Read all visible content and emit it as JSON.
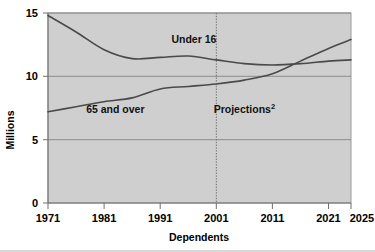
{
  "figure": {
    "background_color": "#ffffff",
    "plot_background_color": "#cfcfcf",
    "plot_border_color": "#9a9a9a",
    "gridline_color": "#8c8c8c",
    "series_line_color": "#4a4a4a",
    "projection_divider_color": "#707070",
    "truncated_title": ""
  },
  "chart_data": {
    "type": "line",
    "title": "",
    "xlabel": "Dependents",
    "ylabel": "Millions",
    "xlim": [
      1971,
      2025
    ],
    "ylim": [
      0,
      15
    ],
    "xticks": [
      1971,
      1981,
      1991,
      2001,
      2011,
      2021,
      2025
    ],
    "xtick_labels": [
      "1971",
      "1981",
      "1991",
      "2001",
      "2011",
      "2021",
      "2025"
    ],
    "yticks": [
      0,
      5,
      10,
      15
    ],
    "ytick_labels": [
      "0",
      "5",
      "10",
      "15"
    ],
    "grid": "horizontal",
    "legend_position": "inline-annotations",
    "annotations": [
      {
        "name": "under-16-label",
        "text": "Under 16",
        "x": 1997,
        "y": 12.6
      },
      {
        "name": "65-and-over-label",
        "text": "65 and over",
        "x": 1983,
        "y": 7.1
      },
      {
        "name": "projections-label",
        "text": "Projections",
        "superscript": "2",
        "x": 2006,
        "y": 7.1
      }
    ],
    "projection_divider": {
      "x": 2001,
      "style": "dotted"
    },
    "x": [
      1971,
      1976,
      1981,
      1986,
      1991,
      1996,
      2001,
      2006,
      2011,
      2016,
      2021,
      2025
    ],
    "series": [
      {
        "name": "Under 16",
        "values": [
          14.8,
          13.5,
          12.1,
          11.4,
          11.5,
          11.6,
          11.3,
          11.0,
          10.9,
          11.0,
          11.2,
          11.3
        ]
      },
      {
        "name": "65 and over",
        "values": [
          7.2,
          7.6,
          8.0,
          8.3,
          9.0,
          9.2,
          9.4,
          9.7,
          10.2,
          11.2,
          12.2,
          12.9
        ]
      }
    ]
  }
}
